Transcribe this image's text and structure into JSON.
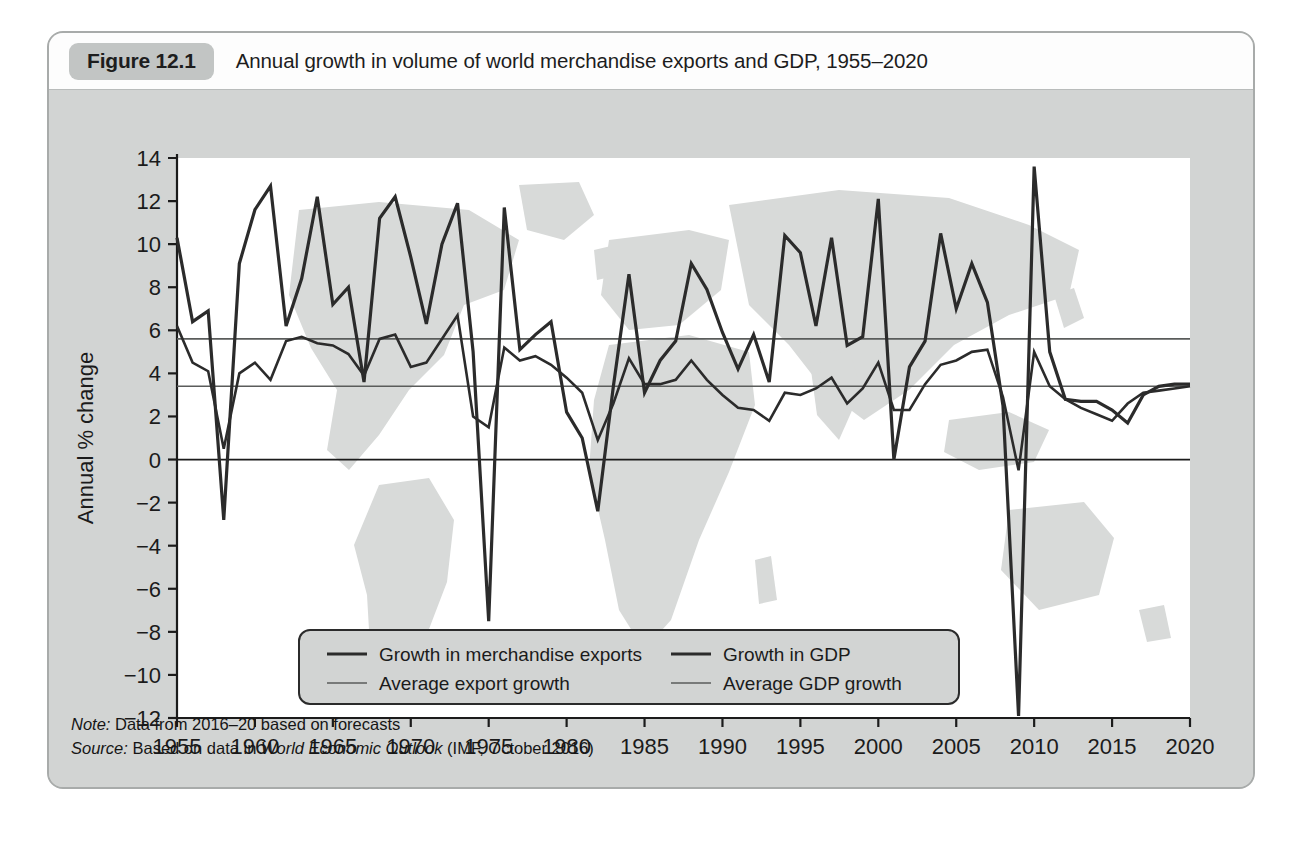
{
  "figure": {
    "badge": "Figure 12.1",
    "title": "Annual growth in volume of world merchandise exports and GDP, 1955–2020"
  },
  "notes": {
    "note_label": "Note:",
    "note_text": "Data from 2016–20 based on forecasts",
    "source_label": "Source:",
    "source_pre": "Based on data in",
    "source_italic": "World Economic Outlook",
    "source_post": "(IMF, October 2016)"
  },
  "colors": {
    "card_bg": "#d2d4d3",
    "title_bg": "#fdfdfd",
    "badge_bg": "#c2c5c4",
    "plot_bg": "#ffffff",
    "map_fill": "#d8dad9",
    "series_dark": "#2b2b2b",
    "series_avg": "#5a5c5b",
    "axis": "#1b1b1b"
  },
  "legend": {
    "position": "inside-bottom-center",
    "entries": [
      {
        "label": "Growth in merchandise exports",
        "color": "#2b2b2b",
        "width": 3.2
      },
      {
        "label": "Growth in GDP",
        "color": "#2b2b2b",
        "width": 3.2
      },
      {
        "label": "Average export growth",
        "color": "#5a5c5b",
        "width": 1.6
      },
      {
        "label": "Average GDP growth",
        "color": "#5a5c5b",
        "width": 1.6
      }
    ]
  },
  "chart_data": {
    "type": "line",
    "title": "Annual growth in volume of world merchandise exports and GDP, 1955–2020",
    "xlabel": "",
    "ylabel": "Annual % change",
    "xlim": [
      1955,
      2020
    ],
    "ylim": [
      -12,
      14
    ],
    "ytick_step": 2,
    "xtick_step": 5,
    "grid": false,
    "yticks": [
      14,
      12,
      10,
      8,
      6,
      4,
      2,
      0,
      -2,
      -4,
      -6,
      -8,
      -10,
      -12
    ],
    "xticks": [
      1955,
      1960,
      1965,
      1970,
      1975,
      1980,
      1985,
      1990,
      1995,
      2000,
      2005,
      2010,
      2015,
      2020
    ],
    "x": [
      1955,
      1956,
      1957,
      1958,
      1959,
      1960,
      1961,
      1962,
      1963,
      1964,
      1965,
      1966,
      1967,
      1968,
      1969,
      1970,
      1971,
      1972,
      1973,
      1974,
      1975,
      1976,
      1977,
      1978,
      1979,
      1980,
      1981,
      1982,
      1983,
      1984,
      1985,
      1986,
      1987,
      1988,
      1989,
      1990,
      1991,
      1992,
      1993,
      1994,
      1995,
      1996,
      1997,
      1998,
      1999,
      2000,
      2001,
      2002,
      2003,
      2004,
      2005,
      2006,
      2007,
      2008,
      2009,
      2010,
      2011,
      2012,
      2013,
      2014,
      2015,
      2016,
      2017,
      2018,
      2019,
      2020
    ],
    "series": [
      {
        "name": "Growth in merchandise exports",
        "color": "#2b2b2b",
        "width": 3.2,
        "values": [
          10.3,
          6.4,
          6.9,
          -2.8,
          9.1,
          11.6,
          12.7,
          6.2,
          8.4,
          12.2,
          7.2,
          8.0,
          3.6,
          11.2,
          12.2,
          9.4,
          6.3,
          10.0,
          11.9,
          5.0,
          -7.5,
          11.7,
          5.1,
          5.8,
          6.4,
          2.2,
          1.0,
          -2.4,
          3.4,
          8.6,
          3.1,
          4.6,
          5.5,
          9.1,
          7.9,
          5.9,
          4.2,
          5.8,
          3.6,
          10.4,
          9.6,
          6.2,
          10.3,
          5.3,
          5.7,
          12.1,
          0.0,
          4.3,
          5.5,
          10.5,
          7.0,
          9.1,
          7.3,
          2.5,
          -11.9,
          13.6,
          5.0,
          2.8,
          2.7,
          2.7,
          2.3,
          1.7,
          3.0,
          3.4,
          3.5,
          3.5
        ]
      },
      {
        "name": "Growth in GDP",
        "color": "#2b2b2b",
        "width": 2.6,
        "values": [
          6.2,
          4.5,
          4.1,
          0.5,
          4.0,
          4.5,
          3.7,
          5.5,
          5.7,
          5.4,
          5.3,
          4.9,
          3.9,
          5.6,
          5.8,
          4.3,
          4.5,
          5.6,
          6.7,
          2.0,
          1.5,
          5.2,
          4.6,
          4.8,
          4.4,
          3.8,
          3.1,
          0.9,
          2.6,
          4.7,
          3.5,
          3.5,
          3.7,
          4.6,
          3.7,
          3.0,
          2.4,
          2.3,
          1.8,
          3.1,
          3.0,
          3.3,
          3.8,
          2.6,
          3.3,
          4.5,
          2.3,
          2.3,
          3.5,
          4.4,
          4.6,
          5.0,
          5.1,
          2.9,
          -0.5,
          5.0,
          3.4,
          2.8,
          2.4,
          2.1,
          1.8,
          2.6,
          3.1,
          3.2,
          3.3,
          3.4
        ]
      },
      {
        "name": "Average export growth",
        "color": "#5a5c5b",
        "width": 1.6,
        "constant": 5.6
      },
      {
        "name": "Average GDP growth",
        "color": "#5a5c5b",
        "width": 1.6,
        "constant": 3.4
      }
    ]
  }
}
